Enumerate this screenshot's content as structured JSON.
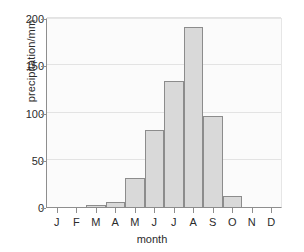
{
  "chart_data": {
    "type": "bar",
    "title": "",
    "subtitle": "",
    "xlabel": "month",
    "ylabel": "precipitation/mm",
    "categories": [
      "J",
      "F",
      "M",
      "A",
      "M",
      "J",
      "J",
      "A",
      "S",
      "O",
      "N",
      "D"
    ],
    "category_names": [
      "January",
      "February",
      "March",
      "April",
      "May",
      "June",
      "July",
      "August",
      "September",
      "October",
      "November",
      "December"
    ],
    "values": [
      0,
      0,
      3,
      6,
      32,
      83,
      134,
      192,
      97,
      13,
      0,
      0
    ],
    "ylim": [
      0,
      200
    ],
    "yticks": [
      0,
      50,
      100,
      150,
      200
    ],
    "ytick_labels": [
      "0",
      "50",
      "100",
      "150",
      "200"
    ],
    "grid": true,
    "grid_axis": "y",
    "legend": false,
    "legend_position": "none",
    "bar_fill_color": "#d9d9d9",
    "bar_edge_color": "#8c8c8c",
    "plot_background_color": "#fbfbfb",
    "gridline_color": "#e3e3e3",
    "axis_color": "#8e8e8e",
    "text_color": "#2b2b2b"
  }
}
